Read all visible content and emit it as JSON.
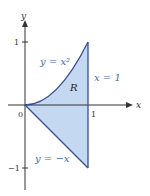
{
  "diagram": {
    "axes": {
      "x_label": "x",
      "y_label": "y"
    },
    "ticks": {
      "origin": "0",
      "x_one": "1",
      "y_one": "1",
      "y_neg_one": "−1"
    },
    "curves": {
      "upper": "y = x²",
      "lower": "y = −x",
      "right": "x = 1"
    },
    "region_label": "R",
    "colors": {
      "fill": "#c5d8f2",
      "curve": "#2f4f9a",
      "label": "#3a6fb0",
      "axis": "#333333"
    }
  }
}
